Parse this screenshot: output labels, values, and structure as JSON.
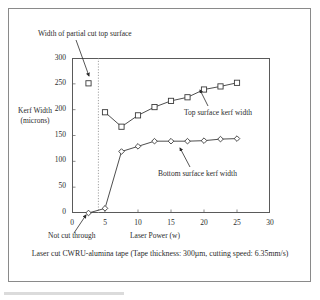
{
  "figure": {
    "caption": "Laser cut CWRU-alumina tape (Tape thickness: 300µm, cutting speed: 6.35mm/s)"
  },
  "annotations": {
    "partial_cut": "Width of partial cut top surface",
    "not_cut_through": "Not cut through",
    "top_series": "Top surface kerf width",
    "bottom_series": "Bottom surface kerf width"
  },
  "chart_data": {
    "type": "line",
    "title": "",
    "subtitle": "",
    "xlabel": "Laser Power (w)",
    "ylabel": "Kerf Width (microns)",
    "ylabel_lines": [
      "Kerf Width",
      "(microns)"
    ],
    "xlim": [
      0,
      30
    ],
    "ylim": [
      0,
      300
    ],
    "xticks": [
      0,
      5,
      10,
      15,
      20,
      25,
      30
    ],
    "yticks": [
      0,
      50,
      100,
      150,
      200,
      250,
      300
    ],
    "grid": false,
    "legend": "annotations-inline",
    "vertical_divider_x": 4,
    "vertical_divider_style": "dotted",
    "series": [
      {
        "name": "Top surface kerf width",
        "marker": "square",
        "points": [
          {
            "x": 5,
            "y": 195
          },
          {
            "x": 7.5,
            "y": 167
          },
          {
            "x": 10,
            "y": 189
          },
          {
            "x": 12.5,
            "y": 205
          },
          {
            "x": 15,
            "y": 217
          },
          {
            "x": 17.5,
            "y": 224
          },
          {
            "x": 20,
            "y": 239
          },
          {
            "x": 22.5,
            "y": 245
          },
          {
            "x": 25,
            "y": 252
          }
        ]
      },
      {
        "name": "Bottom surface kerf width",
        "marker": "diamond",
        "points": [
          {
            "x": 2.5,
            "y": 0
          },
          {
            "x": 5,
            "y": 9
          },
          {
            "x": 7.5,
            "y": 119
          },
          {
            "x": 10,
            "y": 129
          },
          {
            "x": 12.5,
            "y": 139
          },
          {
            "x": 15,
            "y": 139
          },
          {
            "x": 17.5,
            "y": 139
          },
          {
            "x": 20,
            "y": 140
          },
          {
            "x": 22.5,
            "y": 143
          },
          {
            "x": 25,
            "y": 144
          }
        ]
      },
      {
        "name": "Width of partial cut top surface",
        "marker": "square",
        "connected": false,
        "points": [
          {
            "x": 2.5,
            "y": 251
          }
        ]
      }
    ]
  },
  "colors": {
    "line": "#3a3a3a",
    "marker_fill": "#ffffff",
    "frame": "#5a5a5a",
    "outer_frame": "#8a8a8a",
    "text": "#2b2b2b"
  }
}
